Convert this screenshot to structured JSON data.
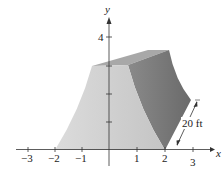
{
  "figure": {
    "x_axis": {
      "label": "x",
      "ticks": [
        {
          "value": -3,
          "label": "−3"
        },
        {
          "value": -2,
          "label": "−2"
        },
        {
          "value": -1,
          "label": "−1"
        },
        {
          "value": 1,
          "label": "1"
        },
        {
          "value": 2,
          "label": "2"
        },
        {
          "value": 3,
          "label": "3"
        }
      ]
    },
    "y_axis": {
      "label": "y",
      "ticks": [
        {
          "value": 4,
          "label": "4"
        }
      ]
    },
    "dimension_label": "20 ft",
    "colors": {
      "front_face": "#d2d2d2",
      "side_face": "#7e7e7e",
      "top_face": "#a9a9a9",
      "axis": "#333333"
    }
  }
}
